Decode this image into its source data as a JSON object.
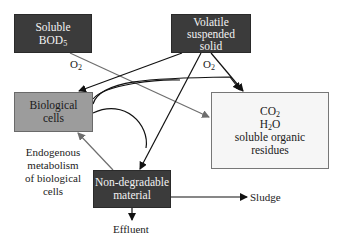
{
  "nodes": {
    "soluble_bod": {
      "line1": "Soluble",
      "line2": "BOD",
      "sub": "5"
    },
    "volatile": {
      "line1": "Volatile",
      "line2": "suspended",
      "line3": "solid"
    },
    "bio_cells": {
      "line1": "Biological",
      "line2": "cells"
    },
    "products": {
      "co2_base": "CO",
      "co2_sub": "2",
      "h2o_a": "H",
      "h2o_sub": "2",
      "h2o_b": "O",
      "line3": "soluble organic",
      "line4": "residues"
    },
    "non_degradable": {
      "line1": "Non-degradable",
      "line2": "material"
    }
  },
  "labels": {
    "o2_left": {
      "base": "O",
      "sub": "2"
    },
    "o2_right": {
      "base": "O",
      "sub": "2"
    },
    "endogenous": [
      "Endogenous",
      "metabolism",
      "of biological",
      "cells"
    ],
    "sludge": "Sludge",
    "effluent": "Effluent"
  },
  "colors": {
    "dark_box": "#3b3b3b",
    "mid_box": "#9c9c9c",
    "light_box": "#f6f6f6",
    "line_black": "#111111",
    "line_gray": "#6e6e6e"
  }
}
